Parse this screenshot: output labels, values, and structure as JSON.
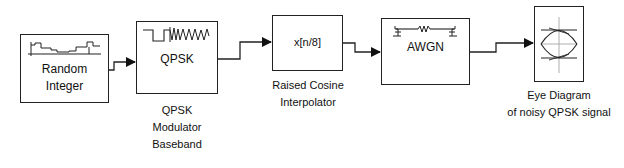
{
  "diagram": {
    "type": "simulink-block-diagram",
    "blocks": [
      {
        "id": "random-integer",
        "inner_lines": [
          "Random",
          "Integer"
        ],
        "caption": []
      },
      {
        "id": "qpsk-modulator",
        "inner_lines": [
          "QPSK"
        ],
        "caption": [
          "QPSK",
          "Modulator",
          "Baseband"
        ]
      },
      {
        "id": "raised-cosine",
        "inner_lines": [
          "x[n/8]"
        ],
        "caption": [
          "Raised Cosine",
          "Interpolator"
        ]
      },
      {
        "id": "awgn",
        "inner_lines": [
          "AWGN"
        ],
        "caption": []
      },
      {
        "id": "eye-diagram",
        "inner_lines": [],
        "caption": [
          "Eye Diagram",
          "of noisy QPSK signal"
        ]
      }
    ],
    "connections": [
      {
        "from": "random-integer",
        "to": "qpsk-modulator"
      },
      {
        "from": "qpsk-modulator",
        "to": "raised-cosine"
      },
      {
        "from": "raised-cosine",
        "to": "awgn"
      },
      {
        "from": "awgn",
        "to": "eye-diagram"
      }
    ],
    "colors": {
      "line": "#222222",
      "background": "#ffffff"
    }
  }
}
